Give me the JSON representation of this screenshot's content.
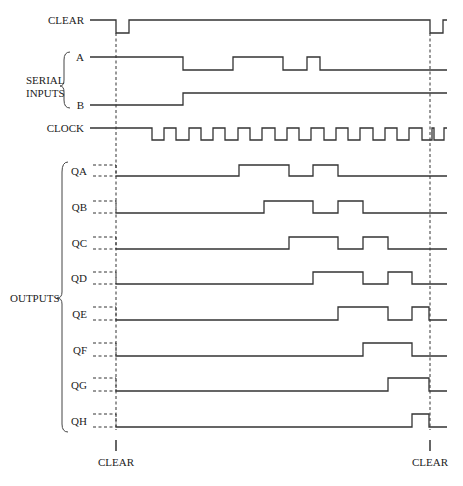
{
  "colors": {
    "line": "#333333",
    "background": "#ffffff"
  },
  "x_start": 90,
  "x_end": 447,
  "clear_marker_left_x": 116,
  "clear_marker_right_x": 430,
  "groups": {
    "serial_inputs": {
      "label_line1": "SERIAL",
      "label_line2": "INPUTS"
    },
    "outputs": {
      "label": "OUTPUTS"
    }
  },
  "bottom_labels": {
    "left": "CLEAR",
    "right": "CLEAR"
  },
  "signals": [
    {
      "name": "CLEAR",
      "high_y": 20,
      "low_y": 33,
      "start": "high",
      "transitions": [
        116,
        129,
        430,
        443
      ]
    },
    {
      "name": "A",
      "high_y": 57,
      "low_y": 70,
      "start": "high",
      "transitions": [
        183,
        233,
        283,
        307,
        320
      ]
    },
    {
      "name": "B",
      "high_y": 93,
      "low_y": 105,
      "start": "low",
      "transitions": [
        183
      ]
    },
    {
      "name": "CLOCK",
      "high_y": 128,
      "low_y": 140,
      "start": "high",
      "transitions": [
        152,
        164,
        176,
        189,
        201,
        213,
        225,
        238,
        250,
        262,
        275,
        287,
        299,
        311,
        324,
        336,
        348,
        360,
        373,
        385,
        397,
        409,
        422,
        432,
        434,
        444
      ]
    },
    {
      "name": "QA",
      "high_y": 165,
      "low_y": 176,
      "start": "low",
      "undefined_before_clear": true,
      "transitions": [
        239,
        289,
        313,
        338
      ]
    },
    {
      "name": "QB",
      "high_y": 201,
      "low_y": 213,
      "start": "low",
      "undefined_before_clear": true,
      "transitions": [
        264,
        313,
        338,
        363
      ]
    },
    {
      "name": "QC",
      "high_y": 237,
      "low_y": 249,
      "start": "low",
      "undefined_before_clear": true,
      "transitions": [
        289,
        338,
        363,
        388
      ]
    },
    {
      "name": "QD",
      "high_y": 272,
      "low_y": 284,
      "start": "low",
      "undefined_before_clear": true,
      "transitions": [
        313,
        363,
        388,
        412
      ]
    },
    {
      "name": "QE",
      "high_y": 307,
      "low_y": 320,
      "start": "low",
      "undefined_before_clear": true,
      "transitions": [
        338,
        388,
        412,
        429
      ]
    },
    {
      "name": "QF",
      "high_y": 343,
      "low_y": 356,
      "start": "low",
      "undefined_before_clear": true,
      "transitions": [
        363,
        412
      ]
    },
    {
      "name": "QG",
      "high_y": 378,
      "low_y": 391,
      "start": "low",
      "undefined_before_clear": true,
      "transitions": [
        388,
        429
      ]
    },
    {
      "name": "QH",
      "high_y": 414,
      "low_y": 427,
      "start": "low",
      "undefined_before_clear": true,
      "transitions": [
        412,
        429
      ]
    }
  ]
}
